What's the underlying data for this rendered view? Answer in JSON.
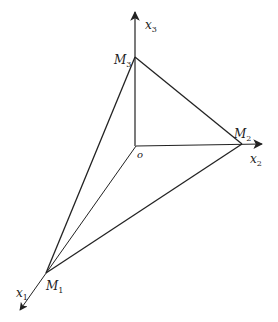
{
  "diagram": {
    "stroke_color": "#222222",
    "origin": {
      "label": "o",
      "x": 136,
      "y": 146
    },
    "axes": [
      {
        "name": "x1",
        "label": "x",
        "subscript": "1",
        "tip": {
          "x": 19,
          "y": 311
        },
        "label_pos": {
          "x": 16,
          "y": 296
        }
      },
      {
        "name": "x2",
        "label": "x",
        "subscript": "2",
        "tip": {
          "x": 263,
          "y": 144
        },
        "label_pos": {
          "x": 251,
          "y": 162
        }
      },
      {
        "name": "x3",
        "label": "x",
        "subscript": "3",
        "tip": {
          "x": 135,
          "y": 11
        },
        "label_pos": {
          "x": 146,
          "y": 28
        }
      }
    ],
    "points": [
      {
        "name": "M1",
        "label": "M",
        "subscript": "1",
        "x": 46,
        "y": 273,
        "label_pos": {
          "x": 46,
          "y": 290
        }
      },
      {
        "name": "M2",
        "label": "M",
        "subscript": "2",
        "x": 242,
        "y": 144,
        "label_pos": {
          "x": 236,
          "y": 138
        }
      },
      {
        "name": "M3",
        "label": "M",
        "subscript": "3",
        "x": 135,
        "y": 57,
        "label_pos": {
          "x": 118,
          "y": 63
        }
      }
    ]
  }
}
